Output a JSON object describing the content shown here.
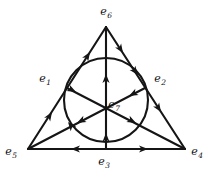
{
  "figure": {
    "kind": "directed-incidence-diagram",
    "name": "fano-plane-with-orientations",
    "canvas": {
      "width": 216,
      "height": 173
    },
    "background_color": "#ffffff",
    "stroke_color": "#151515",
    "stroke_width": 2.1
  },
  "labels": {
    "apex": {
      "text": "e",
      "sub": "6",
      "x": 106,
      "y": 11
    },
    "left_mid": {
      "text": "e",
      "sub": "1",
      "x": 45,
      "y": 78
    },
    "right_mid": {
      "text": "e",
      "sub": "2",
      "x": 160,
      "y": 78
    },
    "center": {
      "text": "e",
      "sub": "7",
      "x": 114,
      "y": 104
    },
    "left_vertex": {
      "text": "e",
      "sub": "5",
      "x": 11,
      "y": 151
    },
    "right_vertex": {
      "text": "e",
      "sub": "4",
      "x": 197,
      "y": 151
    },
    "bottom_mid": {
      "text": "e",
      "sub": "3",
      "x": 104,
      "y": 161
    }
  },
  "points": {
    "e6": {
      "x": 106,
      "y": 27
    },
    "e5": {
      "x": 28,
      "y": 149
    },
    "e4": {
      "x": 185,
      "y": 149
    },
    "e1": {
      "x": 67,
      "y": 88
    },
    "e2": {
      "x": 145,
      "y": 88
    },
    "e3": {
      "x": 106,
      "y": 149
    },
    "e7": {
      "x": 106,
      "y": 100
    }
  },
  "circle": {
    "cx": 106,
    "cy": 100,
    "r": 42
  },
  "lines": [
    {
      "name": "side-e5-e6",
      "from": "e5",
      "to": "e6",
      "d": "M 28 149 L 106 27"
    },
    {
      "name": "side-e6-e4",
      "from": "e6",
      "to": "e4",
      "d": "M 106 27 L 185 149"
    },
    {
      "name": "side-e5-e4",
      "from": "e5",
      "to": "e4",
      "d": "M 28 149 L 185 149"
    },
    {
      "name": "cevian-e6-e3",
      "from": "e6",
      "to": "e3",
      "d": "M 106 27 L 106 149"
    },
    {
      "name": "cevian-e1-e4",
      "from": "e1",
      "to": "e4",
      "d": "M 67 88 L 185 149"
    },
    {
      "name": "cevian-e2-e5",
      "from": "e2",
      "to": "e5",
      "d": "M 145 88 L 28 149"
    }
  ],
  "arrows": [
    {
      "name": "arrow-side-left-lower",
      "x": 52,
      "y": 112,
      "angle": -57.4
    },
    {
      "name": "arrow-side-left-upper",
      "x": 90,
      "y": 52,
      "angle": -57.4
    },
    {
      "name": "arrow-side-right-upper",
      "x": 123,
      "y": 53,
      "angle": 57.1
    },
    {
      "name": "arrow-side-right-lower",
      "x": 161,
      "y": 112,
      "angle": 57.1
    },
    {
      "name": "arrow-bottom-to-e5",
      "x": 71,
      "y": 149,
      "angle": 180
    },
    {
      "name": "arrow-bottom-to-e4",
      "x": 148,
      "y": 149,
      "angle": 0
    },
    {
      "name": "arrow-cevian-vertical-upper",
      "x": 106,
      "y": 74,
      "angle": -90
    },
    {
      "name": "arrow-cevian-vertical-lower",
      "x": 106,
      "y": 133,
      "angle": -90
    },
    {
      "name": "arrow-cevian-e1e4-a",
      "x": 76,
      "y": 92,
      "angle": 27.3
    },
    {
      "name": "arrow-cevian-e1e4-b",
      "x": 136,
      "y": 123,
      "angle": 27.3
    },
    {
      "name": "arrow-cevian-e2e5-a",
      "x": 129,
      "y": 96,
      "angle": 152.5
    },
    {
      "name": "arrow-cevian-e2e5-b",
      "x": 77,
      "y": 123,
      "angle": 152.5
    },
    {
      "name": "arrow-circle-upper-right",
      "x": 138,
      "y": 75,
      "angle": 52
    },
    {
      "name": "arrow-circle-lower-left",
      "x": 68,
      "y": 122,
      "angle": -128
    }
  ]
}
